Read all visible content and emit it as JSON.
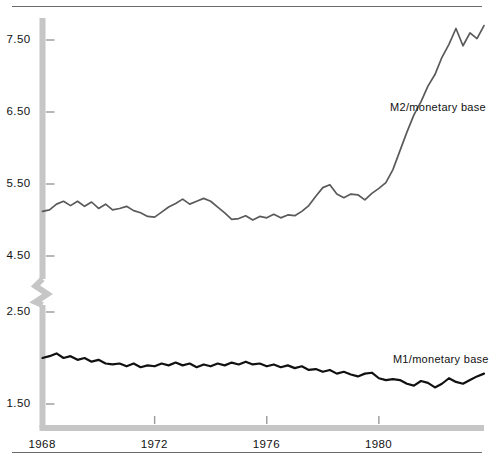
{
  "chart_data": {
    "type": "line",
    "title": "",
    "subtitle": "",
    "xlabel": "",
    "ylabel": "",
    "grid": false,
    "legend_position": "inline-right",
    "broken_axis": true,
    "axis_break_between": [
      2.5,
      4.5
    ],
    "x_tick_labels": [
      "1968",
      "1972",
      "1976",
      "1980"
    ],
    "x_tick_values": [
      1968,
      1972,
      1976,
      1980
    ],
    "xlim": [
      1968,
      1983.75
    ],
    "y_tick_labels_upper": [
      "5.50",
      "6.50",
      "7.50"
    ],
    "y_tick_values_upper": [
      5.5,
      6.5,
      7.5
    ],
    "y_tick_labels_lower": [
      "1.50",
      "2.50"
    ],
    "y_tick_values_lower": [
      1.5,
      2.5
    ],
    "ylim_upper": [
      4.5,
      7.95
    ],
    "ylim_lower": [
      1.3,
      2.5
    ],
    "series": [
      {
        "name": "M2/monetary base",
        "label": "M2/monetary base",
        "color": "#5a5a5a",
        "axis": "upper",
        "x": [
          1968.0,
          1968.25,
          1968.5,
          1968.75,
          1969.0,
          1969.25,
          1969.5,
          1969.75,
          1970.0,
          1970.25,
          1970.5,
          1970.75,
          1971.0,
          1971.25,
          1971.5,
          1971.75,
          1972.0,
          1972.25,
          1972.5,
          1972.75,
          1973.0,
          1973.25,
          1973.5,
          1973.75,
          1974.0,
          1974.25,
          1974.5,
          1974.75,
          1975.0,
          1975.25,
          1975.5,
          1975.75,
          1976.0,
          1976.25,
          1976.5,
          1976.75,
          1977.0,
          1977.25,
          1977.5,
          1977.75,
          1978.0,
          1978.25,
          1978.5,
          1978.75,
          1979.0,
          1979.25,
          1979.5,
          1979.75,
          1980.0,
          1980.25,
          1980.5,
          1980.75,
          1981.0,
          1981.25,
          1981.5,
          1981.75,
          1982.0,
          1982.25,
          1982.5,
          1982.75,
          1983.0,
          1983.25,
          1983.5,
          1983.75
        ],
        "y": [
          5.12,
          5.14,
          5.22,
          5.26,
          5.2,
          5.26,
          5.19,
          5.25,
          5.16,
          5.22,
          5.14,
          5.16,
          5.19,
          5.13,
          5.1,
          5.05,
          5.04,
          5.11,
          5.18,
          5.23,
          5.29,
          5.22,
          5.26,
          5.3,
          5.26,
          5.18,
          5.1,
          5.01,
          5.02,
          5.06,
          5.0,
          5.05,
          5.03,
          5.08,
          5.03,
          5.07,
          5.06,
          5.12,
          5.2,
          5.33,
          5.45,
          5.49,
          5.36,
          5.31,
          5.36,
          5.35,
          5.28,
          5.37,
          5.44,
          5.52,
          5.7,
          5.96,
          6.22,
          6.46,
          6.64,
          6.86,
          7.02,
          7.26,
          7.44,
          7.66,
          7.42,
          7.6,
          7.52,
          7.7
        ],
        "label_x": 1980.4,
        "label_y": 6.55
      },
      {
        "name": "M1/monetary base",
        "label": "M1/monetary base",
        "color": "#111111",
        "axis": "lower",
        "x": [
          1968.0,
          1968.25,
          1968.5,
          1968.75,
          1969.0,
          1969.25,
          1969.5,
          1969.75,
          1970.0,
          1970.25,
          1970.5,
          1970.75,
          1971.0,
          1971.25,
          1971.5,
          1971.75,
          1972.0,
          1972.25,
          1972.5,
          1972.75,
          1973.0,
          1973.25,
          1973.5,
          1973.75,
          1974.0,
          1974.25,
          1974.5,
          1974.75,
          1975.0,
          1975.25,
          1975.5,
          1975.75,
          1976.0,
          1976.25,
          1976.5,
          1976.75,
          1977.0,
          1977.25,
          1977.5,
          1977.75,
          1978.0,
          1978.25,
          1978.5,
          1978.75,
          1979.0,
          1979.25,
          1979.5,
          1979.75,
          1980.0,
          1980.25,
          1980.5,
          1980.75,
          1981.0,
          1981.25,
          1981.5,
          1981.75,
          1982.0,
          1982.25,
          1982.5,
          1982.75,
          1983.0,
          1983.25,
          1983.5,
          1983.75
        ],
        "y": [
          2.0,
          2.02,
          2.05,
          2.0,
          2.02,
          1.98,
          2.0,
          1.96,
          1.98,
          1.94,
          1.93,
          1.94,
          1.91,
          1.94,
          1.9,
          1.92,
          1.91,
          1.94,
          1.92,
          1.95,
          1.92,
          1.94,
          1.9,
          1.93,
          1.91,
          1.94,
          1.92,
          1.95,
          1.93,
          1.96,
          1.93,
          1.94,
          1.91,
          1.93,
          1.9,
          1.92,
          1.89,
          1.91,
          1.87,
          1.88,
          1.85,
          1.87,
          1.83,
          1.85,
          1.82,
          1.8,
          1.83,
          1.84,
          1.78,
          1.76,
          1.77,
          1.76,
          1.72,
          1.7,
          1.75,
          1.73,
          1.68,
          1.72,
          1.78,
          1.74,
          1.72,
          1.76,
          1.8,
          1.83
        ],
        "label_x": 1980.5,
        "label_y": 1.98
      }
    ]
  },
  "axes": {
    "y_labels": [
      {
        "text": "7.50"
      },
      {
        "text": "6.50"
      },
      {
        "text": "5.50"
      },
      {
        "text": "4.50"
      },
      {
        "text": "2.50"
      },
      {
        "text": "1.50"
      }
    ],
    "x_labels": [
      {
        "text": "1968"
      },
      {
        "text": "1972"
      },
      {
        "text": "1976"
      },
      {
        "text": "1980"
      }
    ]
  },
  "labels": {
    "m2": "M2/monetary base",
    "m1": "M1/monetary base"
  },
  "colors": {
    "axis_band": "#c6c6c6",
    "tick": "#9a9a9a",
    "rule": "#6b6b6b",
    "m2_line": "#5a5a5a",
    "m1_line": "#111111",
    "text": "#111111",
    "background": "#ffffff"
  }
}
